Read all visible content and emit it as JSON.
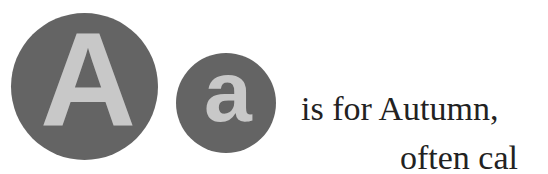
{
  "badges": {
    "uppercase": "A",
    "lowercase": "a",
    "circle_color": "#646464",
    "letter_color": "#c8c8c8"
  },
  "text": {
    "line1": "is for Autumn,",
    "line2": "often cal"
  }
}
